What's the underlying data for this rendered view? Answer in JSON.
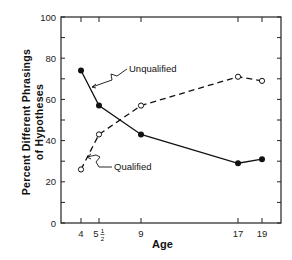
{
  "chart_data": {
    "type": "line",
    "title": "",
    "xlabel": "Age",
    "ylabel": "Percent Different Phrasings of Hypotheses",
    "ylabel_lines": [
      "Percent  Different  Phrasings",
      "of  Hypotheses"
    ],
    "x": [
      4,
      5.5,
      9,
      17,
      19
    ],
    "x_tick_labels": [
      "4",
      "5½",
      "9",
      "17",
      "19"
    ],
    "y_ticks": [
      0,
      20,
      40,
      60,
      80,
      100
    ],
    "ylim": [
      0,
      100
    ],
    "grid": false,
    "legend": "inline annotations",
    "series": [
      {
        "name": "Unqualified",
        "style": "solid",
        "marker": "filled-circle",
        "values": [
          74,
          57,
          43,
          29,
          31
        ]
      },
      {
        "name": "Qualified",
        "style": "dashed",
        "marker": "open-circle",
        "values": [
          26,
          43,
          57,
          71,
          69
        ]
      }
    ],
    "annotations": [
      "Unqualified",
      "Qualified"
    ]
  }
}
